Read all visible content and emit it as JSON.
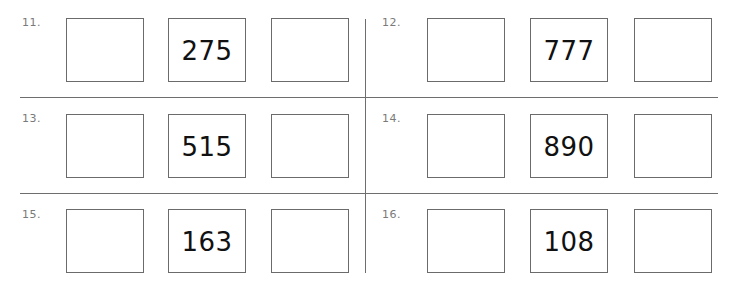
{
  "problems": [
    {
      "number": "11.",
      "given": "275",
      "blank_left": "",
      "blank_right": ""
    },
    {
      "number": "12.",
      "given": "777",
      "blank_left": "",
      "blank_right": ""
    },
    {
      "number": "13.",
      "given": "515",
      "blank_left": "",
      "blank_right": ""
    },
    {
      "number": "14.",
      "given": "890",
      "blank_left": "",
      "blank_right": ""
    },
    {
      "number": "15.",
      "given": "163",
      "blank_left": "",
      "blank_right": ""
    },
    {
      "number": "16.",
      "given": "108",
      "blank_left": "",
      "blank_right": ""
    }
  ],
  "colors": {
    "line": "#6e6e6e",
    "label": "#7a7a7a",
    "text": "#111111"
  }
}
